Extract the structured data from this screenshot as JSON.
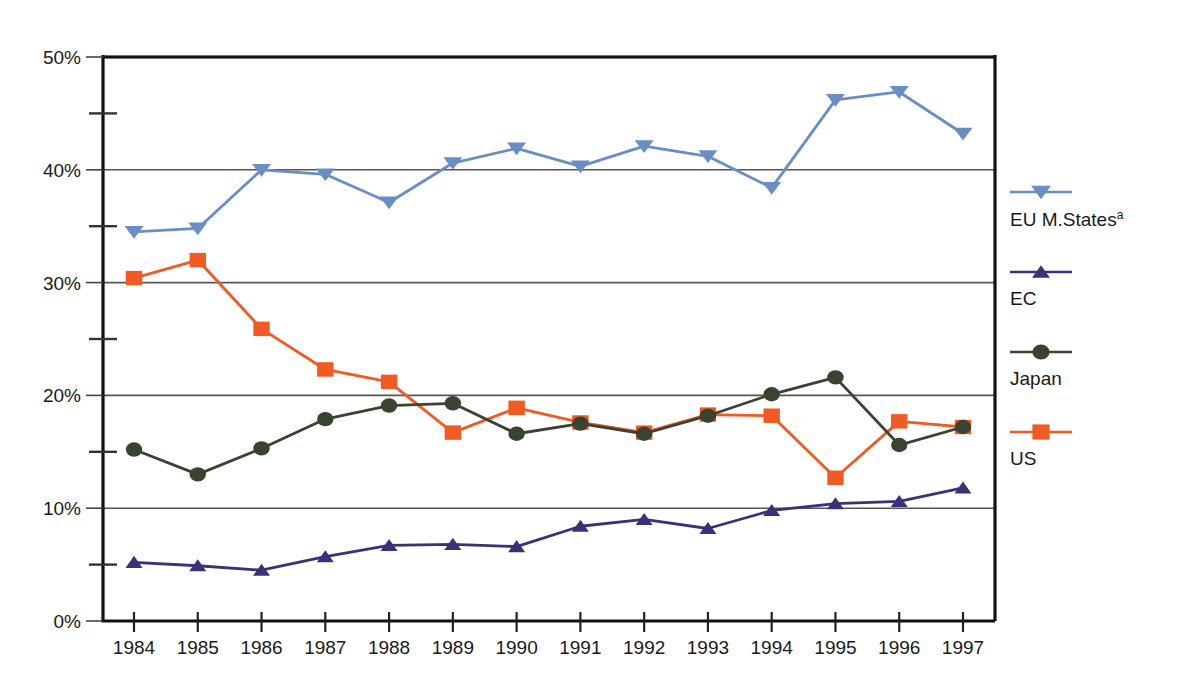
{
  "chart_data": {
    "type": "line",
    "title": "",
    "subtitle": "",
    "xlabel": "",
    "ylabel": "",
    "categories": [
      "1984",
      "1985",
      "1986",
      "1987",
      "1988",
      "1989",
      "1990",
      "1991",
      "1992",
      "1993",
      "1994",
      "1995",
      "1996",
      "1997"
    ],
    "x": [
      1984,
      1985,
      1986,
      1987,
      1988,
      1989,
      1990,
      1991,
      1992,
      1993,
      1994,
      1995,
      1996,
      1997
    ],
    "ylim": [
      0,
      50
    ],
    "ytick_labels": [
      "0%",
      "10%",
      "20%",
      "30%",
      "40%",
      "50%"
    ],
    "ytick_values": [
      0,
      10,
      20,
      30,
      40,
      50
    ],
    "yminor_values": [
      5,
      15,
      25,
      35,
      45
    ],
    "grid": "horizontal-major",
    "legend_position": "right",
    "series": [
      {
        "name": "EU M.States",
        "name_superscript": "a",
        "color": "#6a8ec4",
        "marker": "triangle-down",
        "values": [
          34.5,
          34.8,
          40.0,
          39.6,
          37.1,
          40.6,
          41.9,
          40.3,
          42.1,
          41.2,
          38.4,
          46.2,
          46.9,
          43.2
        ]
      },
      {
        "name": "EC",
        "name_superscript": "",
        "color": "#3b3178",
        "marker": "triangle-up",
        "values": [
          5.2,
          4.9,
          4.5,
          5.7,
          6.7,
          6.8,
          6.6,
          8.4,
          9.0,
          8.2,
          9.8,
          10.4,
          10.6,
          11.8
        ]
      },
      {
        "name": "Japan",
        "name_superscript": "",
        "color": "#3a4232",
        "marker": "circle",
        "values": [
          15.2,
          13.0,
          15.3,
          17.9,
          19.1,
          19.3,
          16.6,
          17.5,
          16.6,
          18.2,
          20.1,
          21.6,
          15.6,
          17.2
        ]
      },
      {
        "name": "US",
        "name_superscript": "",
        "color": "#f15a22",
        "marker": "square",
        "values": [
          30.4,
          32.0,
          25.9,
          22.3,
          21.2,
          16.7,
          18.9,
          17.6,
          16.7,
          18.3,
          18.2,
          12.7,
          17.7,
          17.2
        ]
      }
    ]
  },
  "axes": {
    "frame_color": "#111111",
    "gridline_color": "#555555"
  }
}
